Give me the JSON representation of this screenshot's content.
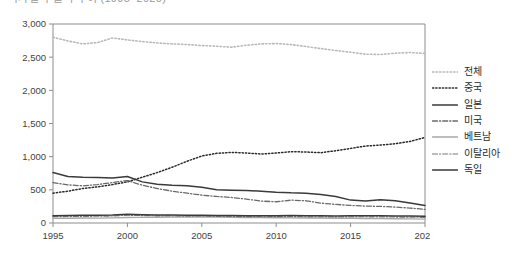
{
  "title_strip": {
    "text": "국가별 수출액 추이 (1995–2020)"
  },
  "chart_data": {
    "type": "line",
    "title": "",
    "xlabel": "",
    "ylabel": "",
    "grid": false,
    "legend_position": "right",
    "xlim": [
      1995,
      2020
    ],
    "ylim": [
      0,
      3000
    ],
    "xticks": [
      1995,
      2000,
      2005,
      2010,
      2015,
      2020
    ],
    "xticklabels": [
      "1995",
      "2000",
      "2005",
      "2010",
      "2015",
      "2020"
    ],
    "yticks": [
      0,
      500,
      1000,
      1500,
      2000,
      2500,
      3000
    ],
    "yticklabels": [
      "0",
      "500",
      "1,000",
      "1,500",
      "2,000",
      "2,500",
      "3,000"
    ],
    "x": [
      1995,
      1996,
      1997,
      1998,
      1999,
      2000,
      2001,
      2002,
      2003,
      2004,
      2005,
      2006,
      2007,
      2008,
      2009,
      2010,
      2011,
      2012,
      2013,
      2014,
      2015,
      2016,
      2017,
      2018,
      2019,
      2020
    ],
    "series": [
      {
        "name": "전체",
        "color": "#b9b9b9",
        "style": "dotted",
        "width": 1.6,
        "values": [
          2800,
          2745,
          2700,
          2720,
          2790,
          2760,
          2735,
          2715,
          2700,
          2690,
          2675,
          2665,
          2650,
          2680,
          2700,
          2705,
          2690,
          2660,
          2630,
          2600,
          2575,
          2545,
          2540,
          2560,
          2570,
          2555
        ]
      },
      {
        "name": "중국",
        "color": "#2a2a2a",
        "style": "dotted",
        "width": 1.5,
        "values": [
          450,
          480,
          520,
          545,
          580,
          620,
          690,
          760,
          840,
          930,
          1010,
          1050,
          1065,
          1055,
          1040,
          1055,
          1075,
          1070,
          1060,
          1090,
          1125,
          1160,
          1175,
          1195,
          1230,
          1290
        ]
      },
      {
        "name": "일본",
        "color": "#3a3a3a",
        "style": "solid",
        "width": 1.5,
        "values": [
          760,
          700,
          690,
          685,
          680,
          700,
          620,
          585,
          570,
          560,
          540,
          500,
          495,
          490,
          480,
          465,
          455,
          450,
          430,
          400,
          345,
          330,
          350,
          335,
          300,
          265
        ]
      },
      {
        "name": "미국",
        "color": "#6a6a6a",
        "style": "dashdot",
        "width": 1.3,
        "values": [
          610,
          575,
          560,
          580,
          610,
          640,
          570,
          520,
          480,
          450,
          420,
          400,
          385,
          360,
          330,
          320,
          345,
          335,
          300,
          280,
          265,
          255,
          250,
          240,
          225,
          205
        ]
      },
      {
        "name": "베트남",
        "color": "#a8a8a8",
        "style": "solid",
        "width": 1.4,
        "values": [
          70,
          72,
          75,
          74,
          78,
          82,
          85,
          86,
          88,
          90,
          90,
          88,
          86,
          84,
          82,
          80,
          78,
          76,
          74,
          72,
          70,
          68,
          66,
          64,
          62,
          58
        ]
      },
      {
        "name": "이탈리아",
        "color": "#7b7b7b",
        "style": "dashdot",
        "width": 1.2,
        "values": [
          95,
          98,
          100,
          102,
          106,
          118,
          112,
          108,
          106,
          104,
          102,
          100,
          98,
          96,
          94,
          95,
          96,
          94,
          92,
          90,
          92,
          94,
          92,
          90,
          88,
          85
        ]
      },
      {
        "name": "독일",
        "color": "#3a3a3a",
        "style": "solid",
        "width": 1.5,
        "values": [
          110,
          112,
          115,
          116,
          120,
          132,
          126,
          122,
          120,
          118,
          116,
          114,
          112,
          110,
          108,
          110,
          112,
          110,
          108,
          106,
          108,
          110,
          108,
          106,
          104,
          100
        ]
      }
    ]
  }
}
